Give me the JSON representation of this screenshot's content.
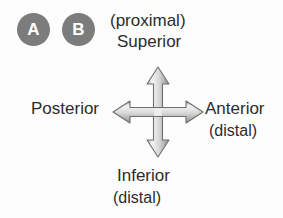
{
  "diagram": {
    "background_color": "#fdfdfd",
    "badges": [
      {
        "label": "A",
        "name": "badge-a",
        "color": "#7c7c7c",
        "text_color": "#ffffff"
      },
      {
        "label": "B",
        "name": "badge-b",
        "color": "#7c7c7c",
        "text_color": "#ffffff"
      }
    ],
    "labels": {
      "top_parenthetical": "(proximal)",
      "top": "Superior",
      "left": "Posterior",
      "right": "Anterior",
      "right_parenthetical": "(distal)",
      "bottom": "Inferior",
      "bottom_parenthetical": "(distal)"
    },
    "text_color": "#2c2c2c",
    "arrow": {
      "name": "four-way-arrow-icon",
      "directions": [
        "up",
        "right",
        "down",
        "left"
      ],
      "outline_color": "#6b6b6b",
      "fill_light": "#fafafa",
      "fill_dark": "#b5b5b5"
    }
  }
}
